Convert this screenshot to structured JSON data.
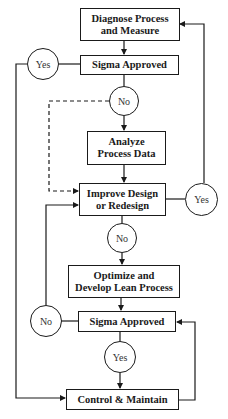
{
  "diagram": {
    "type": "flowchart",
    "nodes": {
      "diagnose": "Diagnose Process and Measure",
      "sigma1": "Sigma Approved",
      "no1": "No",
      "yes1": "Yes",
      "analyze": "Analyze Process Data",
      "improve": "Improve Design or Redesign",
      "yes2": "Yes",
      "no2": "No",
      "optimize": "Optimize and Develop Lean Process",
      "sigma2": "Sigma Approved",
      "no3": "No",
      "yes3": "Yes",
      "control": "Control & Maintain"
    },
    "edges": [
      {
        "from": "diagnose",
        "to": "sigma1"
      },
      {
        "from": "sigma1",
        "to": "yes1",
        "then": "control"
      },
      {
        "from": "sigma1",
        "to": "no1"
      },
      {
        "from": "no1",
        "to": "analyze"
      },
      {
        "from": "no1",
        "to": "improve",
        "style": "dashed"
      },
      {
        "from": "analyze",
        "to": "improve"
      },
      {
        "from": "improve",
        "to": "yes2",
        "then": "diagnose"
      },
      {
        "from": "improve",
        "to": "no2"
      },
      {
        "from": "no2",
        "to": "optimize"
      },
      {
        "from": "optimize",
        "to": "sigma2"
      },
      {
        "from": "sigma2",
        "to": "no3",
        "then": "improve"
      },
      {
        "from": "sigma2",
        "to": "yes3"
      },
      {
        "from": "yes3",
        "to": "control"
      },
      {
        "from": "control",
        "to": "sigma2"
      }
    ]
  },
  "labels": {
    "diagnose_l1": "Diagnose Process",
    "diagnose_l2": "and Measure",
    "sigma1": "Sigma Approved",
    "yes1": "Yes",
    "no1": "No",
    "analyze_l1": "Analyze",
    "analyze_l2": "Process Data",
    "improve_l1": "Improve Design",
    "improve_l2": "or Redesign",
    "yes2": "Yes",
    "no2": "No",
    "optimize_l1": "Optimize and",
    "optimize_l2": "Develop Lean Process",
    "sigma2": "Sigma Approved",
    "no3": "No",
    "yes3": "Yes",
    "control": "Control & Maintain"
  }
}
